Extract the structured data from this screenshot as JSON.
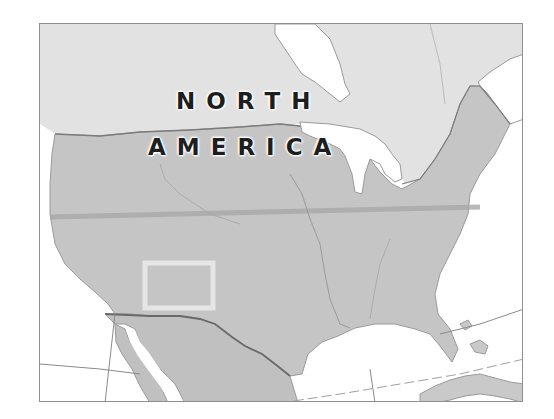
{
  "map": {
    "title_line1": "NORTH",
    "title_line2": "AMERICA",
    "region": "North America",
    "highlighted_feature": "Colorado (rectangular outline)",
    "colors": {
      "canada_land": "#e2e2e2",
      "usa_land": "#c5c5c5",
      "mexico_land": "#c0c0c0",
      "water": "#ffffff",
      "borders": "#7c7c7c",
      "highlight_outline": "#e8e8e8",
      "text": "#1e1e1e",
      "frame_border": "#8f8f8f"
    }
  }
}
